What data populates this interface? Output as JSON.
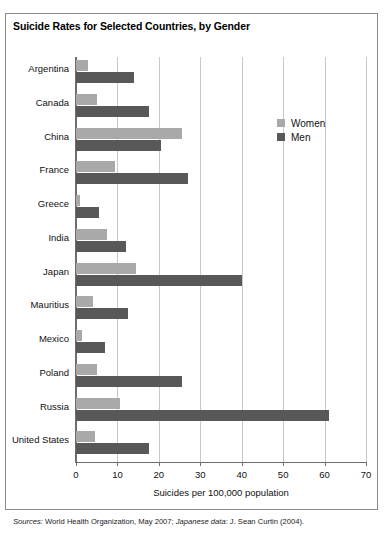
{
  "chart_data": {
    "type": "bar",
    "orientation": "horizontal",
    "title": "Suicide Rates for Selected Countries, by Gender",
    "xlabel": "Suicides per 100,000 population",
    "ylabel": "",
    "xlim": [
      0,
      70
    ],
    "xticks": [
      0,
      10,
      20,
      30,
      40,
      50,
      60,
      70
    ],
    "xtick_labels": [
      "0",
      "10",
      "20",
      "30",
      "40",
      "50",
      "60",
      "70"
    ],
    "grid": "vertical",
    "legend_position": "upper right inside",
    "categories": [
      "Argentina",
      "Canada",
      "China",
      "France",
      "Greece",
      "India",
      "Japan",
      "Mauritius",
      "Mexico",
      "Poland",
      "Russia",
      "United States"
    ],
    "series": [
      {
        "name": "Women",
        "color": "#a9a9a9",
        "values": [
          3.0,
          5.0,
          25.5,
          9.5,
          1.0,
          7.5,
          14.5,
          4.0,
          1.5,
          5.0,
          10.5,
          4.5
        ]
      },
      {
        "name": "Men",
        "color": "#585858",
        "values": [
          14.0,
          17.5,
          20.5,
          27.0,
          5.5,
          12.0,
          40.0,
          12.5,
          7.0,
          25.5,
          61.0,
          17.5
        ]
      }
    ],
    "source_prefix": "Sources:",
    "source_text_1": " World Health Organization, May 2007; ",
    "source_italic_2": "Japanese data",
    "source_text_2": ": J. Sean Curtin (2004)."
  }
}
